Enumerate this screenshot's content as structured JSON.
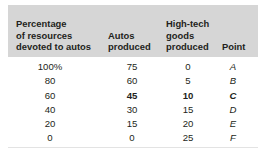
{
  "figure": {
    "kind": "data-table",
    "header_background_color": "#d6d6d6",
    "text_color": "#231f20",
    "rule_color": "#e3e3e3"
  },
  "table": {
    "columns": [
      {
        "key": "percentage",
        "label": "Percentage of resources devoted to autos",
        "label_lines": [
          "Percentage",
          "of resources",
          "devoted to autos"
        ],
        "align": "center"
      },
      {
        "key": "autos",
        "label": "Autos produced",
        "label_lines": [
          "Autos",
          "produced"
        ],
        "align": "center"
      },
      {
        "key": "hightech",
        "label": "High-tech goods produced",
        "label_lines": [
          "High-tech",
          "goods",
          "produced"
        ],
        "align": "center"
      },
      {
        "key": "point",
        "label": "Point",
        "label_lines": [
          "Point"
        ],
        "align": "center"
      }
    ],
    "rows": [
      {
        "percentage": "100%",
        "autos": "75",
        "hightech": "0",
        "point": "A",
        "emphasis": []
      },
      {
        "percentage": "80",
        "autos": "60",
        "hightech": "5",
        "point": "B",
        "emphasis": []
      },
      {
        "percentage": "60",
        "autos": "45",
        "hightech": "10",
        "point": "C",
        "emphasis": [
          "autos",
          "hightech",
          "point"
        ]
      },
      {
        "percentage": "40",
        "autos": "30",
        "hightech": "15",
        "point": "D",
        "emphasis": []
      },
      {
        "percentage": "20",
        "autos": "15",
        "hightech": "20",
        "point": "E",
        "emphasis": []
      },
      {
        "percentage": "0",
        "autos": "0",
        "hightech": "25",
        "point": "F",
        "emphasis": []
      }
    ]
  },
  "chart_data": {
    "type": "table",
    "title": "",
    "xlabel": "Percentage of resources devoted to autos",
    "ylabel": "Output",
    "categories": [
      "A",
      "B",
      "C",
      "D",
      "E",
      "F"
    ],
    "series": [
      {
        "name": "Percentage of resources devoted to autos",
        "values": [
          100,
          80,
          60,
          40,
          20,
          0
        ],
        "unit": "%"
      },
      {
        "name": "Autos produced",
        "values": [
          75,
          60,
          45,
          30,
          15,
          0
        ],
        "unit": ""
      },
      {
        "name": "High-tech goods produced",
        "values": [
          0,
          5,
          10,
          15,
          20,
          25
        ],
        "unit": ""
      }
    ],
    "highlighted_point": "C",
    "grid": false,
    "legend": "none"
  }
}
